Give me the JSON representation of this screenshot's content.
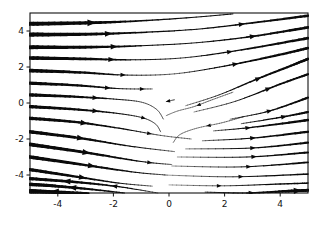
{
  "figure": {
    "background_color": "#ffffff",
    "frame_color": "#111111",
    "stream_color": "#0a0a0a"
  },
  "chart_data": {
    "type": "line",
    "variant": "streamplot",
    "title": "",
    "xlabel": "",
    "ylabel": "",
    "x_range": [
      -5,
      5
    ],
    "y_range": [
      -5,
      5
    ],
    "x_ticks": [
      "-4",
      "-2",
      "0",
      "2",
      "4"
    ],
    "x_tick_values": [
      -4,
      -2,
      0,
      2,
      4
    ],
    "y_ticks": [
      "4",
      "2",
      "0",
      "-2",
      "-4"
    ],
    "y_tick_values": [
      4,
      2,
      0,
      -2,
      -4
    ],
    "grid": false,
    "legend": false,
    "streamlines": [
      {
        "pts": [
          [
            -5,
            4.4,
            4.2
          ],
          [
            -3,
            4.45,
            3.2
          ],
          [
            -1.2,
            4.55,
            1.6
          ],
          [
            0.8,
            4.75,
            1.0
          ],
          [
            2.3,
            4.95,
            1.0
          ]
        ],
        "arrows": [
          0.28
        ]
      },
      {
        "pts": [
          [
            -5,
            3.8,
            4.2
          ],
          [
            -3,
            3.82,
            3.0
          ],
          [
            -1,
            3.92,
            1.4
          ],
          [
            1,
            4.1,
            1.0
          ],
          [
            3,
            4.45,
            1.6
          ],
          [
            5,
            4.85,
            2.6
          ]
        ],
        "arrows": [
          0.27,
          0.76
        ]
      },
      {
        "pts": [
          [
            -5,
            3.1,
            4.0
          ],
          [
            -3,
            3.1,
            2.8
          ],
          [
            -1,
            3.18,
            1.2
          ],
          [
            1,
            3.35,
            0.9
          ],
          [
            3,
            3.7,
            1.6
          ],
          [
            5,
            4.2,
            2.8
          ]
        ],
        "arrows": [
          0.3,
          0.8
        ]
      },
      {
        "pts": [
          [
            -5,
            2.5,
            3.8
          ],
          [
            -3,
            2.45,
            2.6
          ],
          [
            -1.2,
            2.4,
            1.0
          ],
          [
            0.6,
            2.52,
            0.8
          ],
          [
            2.6,
            2.95,
            1.4
          ],
          [
            5,
            3.6,
            2.8
          ]
        ],
        "arrows": [
          0.3,
          0.76
        ]
      },
      {
        "pts": [
          [
            -5,
            1.8,
            3.8
          ],
          [
            -3.2,
            1.7,
            2.4
          ],
          [
            -1.5,
            1.55,
            0.9
          ],
          [
            0.2,
            1.62,
            0.6
          ],
          [
            2,
            2.05,
            1.2
          ],
          [
            3.8,
            2.62,
            2.2
          ],
          [
            5,
            3.05,
            2.6
          ]
        ],
        "arrows": [
          0.32,
          0.7
        ]
      },
      {
        "pts": [
          [
            -5,
            1.1,
            3.4
          ],
          [
            -3.3,
            0.98,
            2.2
          ],
          [
            -1.8,
            0.8,
            0.9
          ],
          [
            -0.6,
            0.78,
            0.6
          ]
        ],
        "arrows": [
          0.55,
          0.85
        ]
      },
      {
        "pts": [
          [
            -5,
            0.45,
            3.4
          ],
          [
            -3.4,
            0.35,
            2.2
          ],
          [
            -2,
            0.22,
            1.0
          ],
          [
            -1.0,
            0.05,
            0.6
          ],
          [
            -0.45,
            -0.35,
            0.5
          ],
          [
            -0.2,
            -0.9,
            0.45
          ]
        ],
        "arrows": [
          0.3
        ]
      },
      {
        "pts": [
          [
            -5,
            -0.2,
            3.4
          ],
          [
            -3.4,
            -0.35,
            2.2
          ],
          [
            -2,
            -0.55,
            1.1
          ],
          [
            -1.0,
            -0.8,
            0.7
          ],
          [
            -0.5,
            -1.15,
            0.5
          ],
          [
            -0.3,
            -1.6,
            0.45
          ]
        ],
        "arrows": [
          0.3,
          0.62
        ]
      },
      {
        "pts": [
          [
            -5,
            -0.85,
            3.4
          ],
          [
            -3.4,
            -1.05,
            2.4
          ],
          [
            -1.8,
            -1.4,
            1.2
          ],
          [
            -0.3,
            -1.8,
            0.6
          ],
          [
            0.8,
            -2.0,
            0.5
          ]
        ],
        "arrows": [
          0.3,
          0.68
        ]
      },
      {
        "pts": [
          [
            -5,
            -1.6,
            3.6
          ],
          [
            -3.2,
            -1.95,
            2.4
          ],
          [
            -1.4,
            -2.4,
            1.1
          ],
          [
            0.2,
            -2.7,
            0.5
          ]
        ],
        "arrows": [
          0.33
        ]
      },
      {
        "pts": [
          [
            -5,
            -2.3,
            3.8
          ],
          [
            -3,
            -2.75,
            2.5
          ],
          [
            -1,
            -3.25,
            1.1
          ],
          [
            0.1,
            -3.42,
            0.5
          ]
        ],
        "arrows": [
          0.32,
          0.72
        ]
      },
      {
        "pts": [
          [
            -5,
            -3.0,
            3.8
          ],
          [
            -3,
            -3.45,
            2.4
          ],
          [
            -1.2,
            -3.85,
            1.1
          ],
          [
            -0.1,
            -4.0,
            0.5
          ]
        ],
        "arrows": [
          0.35
        ]
      },
      {
        "pts": [
          [
            -5,
            -3.7,
            3.4
          ],
          [
            -3.3,
            -4.1,
            2.2
          ],
          [
            -1.8,
            -4.45,
            1.0
          ],
          [
            -0.6,
            -4.62,
            0.5
          ]
        ],
        "arrows": [
          0.35
        ]
      },
      {
        "pts": [
          [
            -0.4,
            -5.0,
            0.5
          ],
          [
            -1.8,
            -4.65,
            1.3
          ],
          [
            -3.3,
            -4.4,
            2.4
          ],
          [
            -5,
            -4.2,
            3.2
          ]
        ],
        "arrows": [
          0.35,
          0.72
        ]
      },
      {
        "pts": [
          [
            -1.6,
            -5.0,
            1.0
          ],
          [
            -2.9,
            -4.78,
            2.0
          ],
          [
            -4.2,
            -4.6,
            3.0
          ],
          [
            -5,
            -4.52,
            3.4
          ]
        ],
        "arrows": [
          0.45
        ]
      },
      {
        "pts": [
          [
            -2.9,
            -5.02,
            2.2
          ],
          [
            -4.1,
            -4.95,
            3.6
          ],
          [
            -5,
            -4.9,
            4.4
          ]
        ],
        "arrows": [
          0.5
        ]
      },
      {
        "pts": [
          [
            1.6,
            -1.55,
            0.5
          ],
          [
            3,
            -1.35,
            1.3
          ],
          [
            5,
            -0.95,
            2.6
          ]
        ],
        "arrows": [
          0.45
        ]
      },
      {
        "pts": [
          [
            0.6,
            -0.15,
            0.45
          ],
          [
            1.8,
            0.45,
            0.8
          ],
          [
            3.2,
            1.35,
            1.6
          ],
          [
            4.6,
            2.2,
            2.4
          ],
          [
            5,
            2.45,
            2.5
          ]
        ],
        "arrows": [
          0.5
        ]
      },
      {
        "pts": [
          [
            0.9,
            -0.5,
            0.45
          ],
          [
            2.4,
            0.1,
            0.8
          ],
          [
            4,
            1.05,
            1.8
          ],
          [
            5,
            1.6,
            2.2
          ]
        ],
        "arrows": [
          0.55
        ]
      },
      {
        "pts": [
          [
            2.2,
            -0.9,
            0.5
          ],
          [
            3.6,
            -0.45,
            1.2
          ],
          [
            5,
            0.3,
            2.2
          ]
        ],
        "arrows": [
          0.5
        ]
      },
      {
        "pts": [
          [
            2.6,
            -1.15,
            0.6
          ],
          [
            4,
            -0.8,
            1.4
          ],
          [
            5,
            -0.5,
            2.2
          ]
        ],
        "arrows": [
          0.55
        ]
      },
      {
        "pts": [
          [
            1.2,
            -2.1,
            0.5
          ],
          [
            3,
            -1.95,
            1.2
          ],
          [
            5,
            -1.6,
            2.4
          ]
        ],
        "arrows": [
          0.5
        ]
      },
      {
        "pts": [
          [
            0.6,
            -2.55,
            0.45
          ],
          [
            3,
            -2.5,
            1.1
          ],
          [
            5,
            -2.2,
            2.2
          ]
        ],
        "arrows": [
          0.5
        ]
      },
      {
        "pts": [
          [
            0.3,
            -3.0,
            0.4
          ],
          [
            2.8,
            -3.0,
            1.0
          ],
          [
            5,
            -2.75,
            2.0
          ]
        ],
        "arrows": [
          0.55
        ]
      },
      {
        "pts": [
          [
            0.1,
            -3.5,
            0.4
          ],
          [
            2.6,
            -3.55,
            0.9
          ],
          [
            5,
            -3.3,
            1.8
          ]
        ],
        "arrows": [
          0.55
        ]
      },
      {
        "pts": [
          [
            -0.2,
            -4.0,
            0.35
          ],
          [
            2.3,
            -4.1,
            0.8
          ],
          [
            5,
            -3.95,
            1.6
          ]
        ],
        "arrows": [
          0.55
        ]
      },
      {
        "pts": [
          [
            0,
            -4.55,
            0.35
          ],
          [
            2,
            -4.6,
            0.7
          ],
          [
            4,
            -4.5,
            1.3
          ],
          [
            5,
            -4.45,
            1.5
          ]
        ],
        "arrows": [
          0.3
        ]
      },
      {
        "pts": [
          [
            1.3,
            -4.95,
            0.7
          ],
          [
            2.8,
            -5.0,
            1.2
          ],
          [
            4.2,
            -4.9,
            2.6
          ],
          [
            5,
            -4.85,
            3.0
          ]
        ],
        "arrows": [
          0.35,
          0.8
        ]
      },
      {
        "pts": [
          [
            2.3,
            0.6,
            0.5
          ],
          [
            1.5,
            0.15,
            0.5
          ],
          [
            0.9,
            -0.2,
            0.45
          ],
          [
            0.3,
            -0.45,
            0.4
          ],
          [
            -0.1,
            -0.7,
            0.35
          ]
        ],
        "arrows": [
          0.42
        ]
      },
      {
        "pts": [
          [
            2.7,
            -0.75,
            0.55
          ],
          [
            1.9,
            -1.1,
            0.5
          ],
          [
            1.0,
            -1.4,
            0.45
          ],
          [
            0.4,
            -1.75,
            0.4
          ],
          [
            0.15,
            -2.2,
            0.35
          ]
        ],
        "arrows": [
          0.38
        ]
      },
      {
        "pts": [
          [
            0.2,
            0.18,
            0.5
          ],
          [
            -0.1,
            0.08,
            0.4
          ]
        ],
        "arrows": [
          0.7
        ]
      }
    ]
  }
}
